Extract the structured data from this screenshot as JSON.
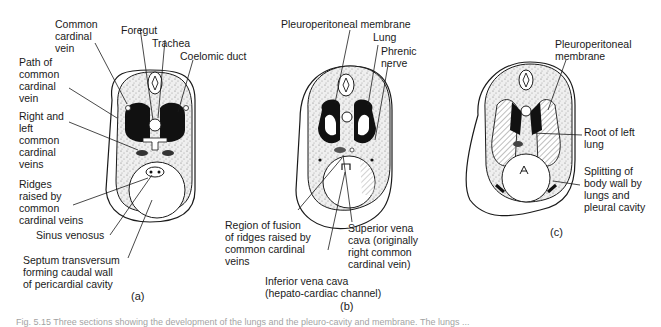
{
  "figure": {
    "caption": "Fig. 5.15  Three sections showing the development of the lungs and the pleuro-cavity and membrane. The lungs ..."
  },
  "panels": [
    {
      "id": "a",
      "label": "(a)",
      "annotations": [
        {
          "text": "Common\ncardinal\nvein"
        },
        {
          "text": "Foregut"
        },
        {
          "text": "Trachea"
        },
        {
          "text": "Coelomic duct"
        },
        {
          "text": "Path of\ncommon\ncardinal\nvein"
        },
        {
          "text": "Right and\nleft\ncommon\ncardinal\nveins"
        },
        {
          "text": "Ridges\nraised by\ncommon\ncardinal veins"
        },
        {
          "text": "Sinus venosus"
        },
        {
          "text": "Septum transversum\nforming caudal wall\nof pericardial cavity"
        }
      ]
    },
    {
      "id": "b",
      "label": "(b)",
      "annotations": [
        {
          "text": "Pleuroperitoneal membrane"
        },
        {
          "text": "Lung"
        },
        {
          "text": "Phrenic\nnerve"
        },
        {
          "text": "Region of fusion\nof ridges raised by\ncommon cardinal\nveins"
        },
        {
          "text": "Superior vena\ncava (originally\nright common\ncardinal vein)"
        },
        {
          "text": "Inferior vena cava\n(hepato-cardiac channel)"
        }
      ]
    },
    {
      "id": "c",
      "label": "(c)",
      "annotations": [
        {
          "text": "Pleuroperitoneal\nmembrane"
        },
        {
          "text": "Root of left\nlung"
        },
        {
          "text": "Splitting of\nbody wall by\nlungs and\npleural cavity"
        }
      ]
    }
  ],
  "colors": {
    "ink": "#1a1a1a",
    "stipple": "#8a8a8a",
    "background": "#ffffff"
  }
}
